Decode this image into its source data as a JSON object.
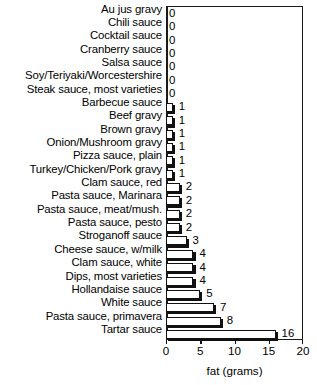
{
  "chart_data": {
    "type": "bar",
    "orientation": "horizontal",
    "title": "",
    "xlabel": "fat (grams)",
    "ylabel": "",
    "xlim": [
      0,
      20
    ],
    "xticks": [
      0,
      5,
      10,
      15,
      20
    ],
    "xticklabels": [
      "0",
      "5",
      "10",
      "15",
      "20"
    ],
    "grid": false,
    "legend": false,
    "show_value_labels": true,
    "categories": [
      "Au jus gravy",
      "Chili sauce",
      "Cocktail sauce",
      "Cranberry sauce",
      "Salsa sauce",
      "Soy/Teriyaki/Worcestershire",
      "Steak sauce, most varieties",
      "Barbecue sauce",
      "Beef gravy",
      "Brown gravy",
      "Onion/Mushroom gravy",
      "Pizza sauce, plain",
      "Turkey/Chicken/Pork gravy",
      "Clam sauce, red",
      "Pasta sauce, Marinara",
      "Pasta sauce, meat/mush.",
      "Pasta sauce, pesto",
      "Stroganoff sauce",
      "Cheese sauce, w/milk",
      "Clam sauce, white",
      "Dips, most varieties",
      "Hollandaise sauce",
      "White sauce",
      "Pasta sauce, primavera",
      "Tartar sauce"
    ],
    "values": [
      0,
      0,
      0,
      0,
      0,
      0,
      0,
      1,
      1,
      1,
      1,
      1,
      1,
      2,
      2,
      2,
      2,
      3,
      4,
      4,
      4,
      5,
      7,
      8,
      16
    ],
    "value_labels": [
      "0",
      "0",
      "0",
      "0",
      "0",
      "0",
      "0",
      "1",
      "1",
      "1",
      "1",
      "1",
      "1",
      "2",
      "2",
      "2",
      "2",
      "3",
      "4",
      "4",
      "4",
      "5",
      "7",
      "8",
      "16"
    ],
    "colors": {
      "bar_face": "#ffffff",
      "bar_edge": "#111111",
      "bar_shadow": "#111111",
      "axis": "#1a1a1a",
      "text": "#000000",
      "background": "#ffffff"
    }
  }
}
